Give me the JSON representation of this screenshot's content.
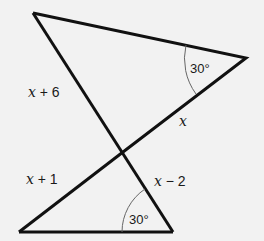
{
  "diagram": {
    "type": "geometry-triangles",
    "background": "#f2f2f2",
    "line_color": "#111111",
    "arc_color": "#666666",
    "points": {
      "top_left": [
        33,
        13
      ],
      "right": [
        246,
        58
      ],
      "intersection": [
        123,
        152
      ],
      "bottom_left": [
        19,
        232
      ],
      "bottom_right": [
        173,
        232
      ]
    },
    "labels": {
      "top_angle": "30°",
      "bottom_angle": "30°",
      "seg_upper_left_var": "x",
      "seg_upper_left_rest": " + 6",
      "seg_upper_right_var": "x",
      "seg_lower_left_var": "x",
      "seg_lower_left_rest": " + 1",
      "seg_lower_right_var": "x",
      "seg_lower_right_rest": " − 2"
    }
  }
}
